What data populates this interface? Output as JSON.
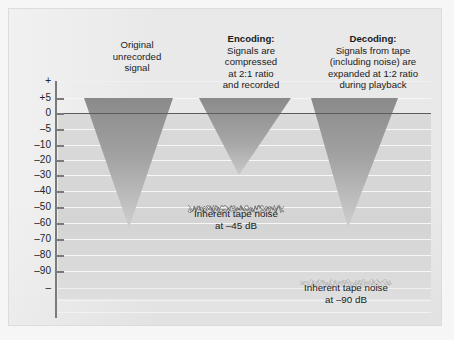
{
  "figure": {
    "title_hidden": "",
    "background_color": "#e9e9e9",
    "zero_line_color": "#5c5c5c",
    "wedge_color_top": "#8c8c8c",
    "wedge_color_bottom": "#c8c8c8"
  },
  "axis": {
    "name": "decibel-scale",
    "unit": "dB",
    "ticks": [
      {
        "label": "+",
        "value": null,
        "y": 80
      },
      {
        "label": "+5",
        "value": 5,
        "y": 97
      },
      {
        "label": "0",
        "value": 0,
        "y": 112
      },
      {
        "label": "–5",
        "value": -5,
        "y": 128
      },
      {
        "label": "–10",
        "value": -10,
        "y": 144
      },
      {
        "label": "–20",
        "value": -20,
        "y": 159
      },
      {
        "label": "–30",
        "value": -30,
        "y": 174
      },
      {
        "label": "–40",
        "value": -40,
        "y": 190
      },
      {
        "label": "–50",
        "value": -50,
        "y": 206
      },
      {
        "label": "–60",
        "value": -60,
        "y": 222
      },
      {
        "label": "–70",
        "value": -70,
        "y": 238
      },
      {
        "label": "–80",
        "value": -80,
        "y": 254
      },
      {
        "label": "–90",
        "value": -90,
        "y": 270
      },
      {
        "label": "–",
        "value": null,
        "y": 287
      }
    ]
  },
  "columns": [
    {
      "id": "original",
      "heading_bold": "",
      "heading_lines": [
        "Original",
        "unrecorded",
        "signal"
      ],
      "signal": {
        "top_db": 5,
        "bottom_db": -63,
        "top_left_x": 83,
        "top_right_x": 172,
        "apex_x": 128
      }
    },
    {
      "id": "encoding",
      "heading_bold": "Encoding:",
      "heading_lines": [
        "Signals are",
        "compressed",
        "at 2:1 ratio",
        "and recorded"
      ],
      "signal": {
        "top_db": 5,
        "bottom_db": -30,
        "top_left_x": 198,
        "top_right_x": 290,
        "apex_x": 238
      }
    },
    {
      "id": "decoding",
      "heading_bold": "Decoding:",
      "heading_lines": [
        "Signals from tape",
        "(including noise) are",
        "expanded at 1:2 ratio",
        "during playback"
      ],
      "signal": {
        "top_db": 5,
        "bottom_db": -63,
        "top_left_x": 310,
        "top_right_x": 397,
        "apex_x": 347
      }
    }
  ],
  "noise_annotations": [
    {
      "id": "tape-noise-45",
      "line1": "Inherent tape noise",
      "line2": "at –45 dB",
      "level_db": -45,
      "band_left_x": 187,
      "band_width": 96,
      "band_y": 198
    },
    {
      "id": "tape-noise-90",
      "line1": "Inherent tape noise",
      "line2": "at –90 dB",
      "level_db": -90,
      "band_left_x": 299,
      "band_width": 92,
      "band_y": 272
    }
  ],
  "chart_data": {
    "type": "area",
    "xlabel": "",
    "ylabel": "dB",
    "ylim": [
      -95,
      8
    ],
    "grid": true,
    "legend_position": "none",
    "yticks": [
      "+",
      "+5",
      "0",
      "–5",
      "–10",
      "–20",
      "–30",
      "–40",
      "–50",
      "–60",
      "–70",
      "–80",
      "–90",
      "–"
    ],
    "series": [
      {
        "name": "Original unrecorded signal",
        "top_db": 5,
        "bottom_db": -63
      },
      {
        "name": "Encoding: compressed at 2:1",
        "top_db": 5,
        "bottom_db": -30
      },
      {
        "name": "Decoding: expanded at 1:2",
        "top_db": 5,
        "bottom_db": -63
      }
    ],
    "annotations": [
      {
        "text": "Inherent tape noise at –45 dB",
        "value": -45
      },
      {
        "text": "Inherent tape noise at –90 dB",
        "value": -90
      }
    ]
  }
}
